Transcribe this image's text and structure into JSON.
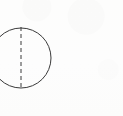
{
  "figure": {
    "canvas": {
      "width": 123,
      "height": 116,
      "background_color": "#fdfdfc",
      "description": "scanned line drawing on off-white paper, mostly blank on the right side"
    },
    "ink_color": "#3a3a3a",
    "shapes": {
      "circle": {
        "name": "circle-outline",
        "center_x": 21,
        "center_y": 58,
        "radius": 30,
        "stroke_color": "#3a3a3a",
        "stroke_width": 1,
        "fill": "none",
        "clipped_edge": "left",
        "bounds": {
          "left": -9,
          "top": 28,
          "right": 51,
          "bottom": 88
        }
      },
      "centerline": {
        "name": "vertical-dashed-centerline",
        "x": 21,
        "y_start": 27,
        "y_end": 89,
        "stroke_color": "#3a3a3a",
        "stroke_width": 1,
        "dash_on": 4,
        "dash_off": 3,
        "orientation": "vertical"
      }
    },
    "labels": [],
    "annotations": []
  }
}
